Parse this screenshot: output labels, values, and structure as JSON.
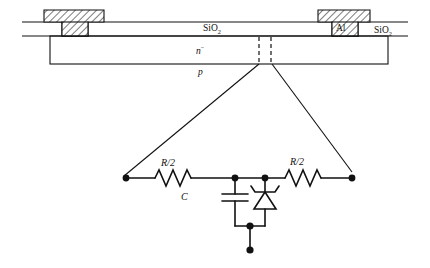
{
  "figure": {
    "colors": {
      "line": "#111111",
      "hatch": "#111111",
      "background": "#ffffff"
    }
  },
  "cross_section": {
    "labels": {
      "oxide_mid": "SiO",
      "oxide_mid_sub": "2",
      "metal": "Al",
      "oxide_right": "SiO",
      "oxide_right_sub": "2",
      "n_region": "n",
      "n_region_sup": "−",
      "p_region": "p"
    },
    "contacts": [
      {
        "name": "left-contact",
        "fill": "hatched"
      },
      {
        "name": "right-contact",
        "fill": "hatched"
      }
    ],
    "junction": {
      "name": "junction-dashed-region",
      "style": "dashed"
    }
  },
  "circuit": {
    "labels": {
      "resistor_left": "R/2",
      "resistor_right": "R/2",
      "capacitor": "C"
    },
    "components": [
      {
        "name": "resistor-left",
        "label": "R/2",
        "type": "resistor"
      },
      {
        "name": "resistor-right",
        "label": "R/2",
        "type": "resistor"
      },
      {
        "name": "capacitor",
        "label": "C",
        "type": "capacitor"
      },
      {
        "name": "diode",
        "label": "",
        "type": "zener-diode"
      }
    ],
    "terminals": [
      {
        "name": "terminal-left"
      },
      {
        "name": "terminal-right"
      },
      {
        "name": "terminal-ground"
      }
    ]
  }
}
